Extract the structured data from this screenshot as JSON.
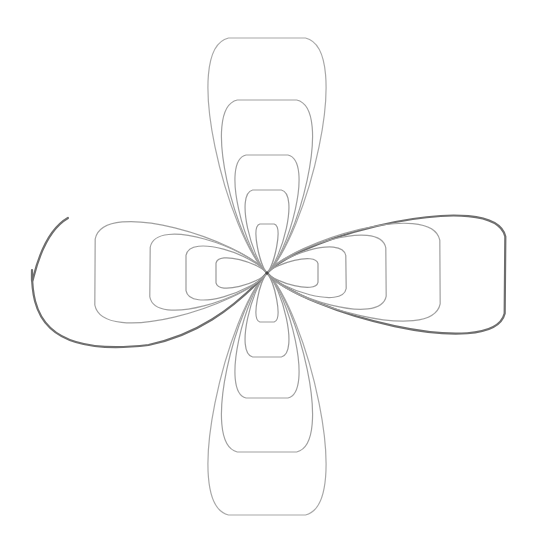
{
  "figure": {
    "background": "#ffffff",
    "center": [
      267,
      273
    ],
    "colors": {
      "light_stroke": "#9a9a9a",
      "dark_stroke": "#5a5a5a"
    },
    "petals": [
      {
        "direction": "up",
        "loops": [
          {
            "tip": [
              267,
              38
            ],
            "half_width": 70,
            "stroke": "#a8a8a8",
            "width": 1.2
          },
          {
            "tip": [
              267,
              100
            ],
            "half_width": 54,
            "stroke": "#a0a0a0",
            "width": 1.2
          },
          {
            "tip": [
              267,
              155
            ],
            "half_width": 38,
            "stroke": "#a0a0a0",
            "width": 1.2
          },
          {
            "tip": [
              267,
              190
            ],
            "half_width": 26,
            "stroke": "#9c9c9c",
            "width": 1.2
          },
          {
            "tip": [
              267,
              224
            ],
            "half_width": 13,
            "stroke": "#999999",
            "width": 1.2
          }
        ]
      },
      {
        "direction": "down",
        "loops": [
          {
            "tip": [
              267,
              515
            ],
            "half_width": 70,
            "stroke": "#a8a8a8",
            "width": 1.2
          },
          {
            "tip": [
              267,
              452
            ],
            "half_width": 54,
            "stroke": "#a0a0a0",
            "width": 1.2
          },
          {
            "tip": [
              267,
              398
            ],
            "half_width": 38,
            "stroke": "#a0a0a0",
            "width": 1.2
          },
          {
            "tip": [
              267,
              357
            ],
            "half_width": 26,
            "stroke": "#9c9c9c",
            "width": 1.2
          },
          {
            "tip": [
              267,
              322
            ],
            "half_width": 13,
            "stroke": "#999999",
            "width": 1.2
          }
        ]
      },
      {
        "direction": "right",
        "loops": [
          {
            "tip": [
              505,
              275
            ],
            "half_width": 70,
            "stroke": "#6e6e6e",
            "width": 2.2
          },
          {
            "tip": [
              440,
              272
            ],
            "half_width": 58,
            "stroke": "#a0a0a0",
            "width": 1.2
          },
          {
            "tip": [
              386,
              272
            ],
            "half_width": 44,
            "stroke": "#a0a0a0",
            "width": 1.2
          },
          {
            "tip": [
              346,
              272
            ],
            "half_width": 30,
            "stroke": "#9c9c9c",
            "width": 1.2
          },
          {
            "tip": [
              318,
              273
            ],
            "half_width": 17,
            "stroke": "#999999",
            "width": 1.2
          }
        ]
      },
      {
        "direction": "left",
        "loops": [
          {
            "tip": [
              32,
              270
            ],
            "half_width": 70,
            "stroke": "#6e6e6e",
            "width": 2.2,
            "open": true
          },
          {
            "tip": [
              95,
              272
            ],
            "half_width": 60,
            "stroke": "#a0a0a0",
            "width": 1.2
          },
          {
            "tip": [
              150,
              272
            ],
            "half_width": 45,
            "stroke": "#a0a0a0",
            "width": 1.2
          },
          {
            "tip": [
              186,
              273
            ],
            "half_width": 32,
            "stroke": "#9c9c9c",
            "width": 1.2
          },
          {
            "tip": [
              216,
              273
            ],
            "half_width": 18,
            "stroke": "#999999",
            "width": 1.2
          }
        ]
      }
    ]
  }
}
